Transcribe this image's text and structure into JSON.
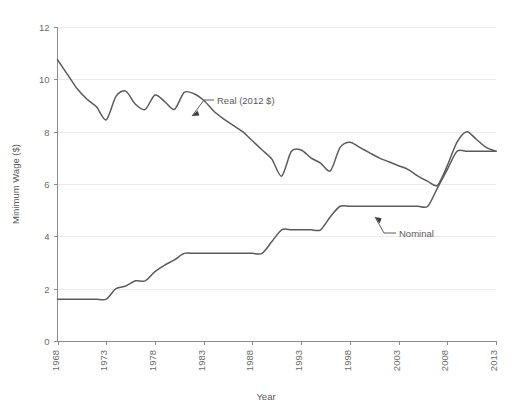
{
  "chart_data": {
    "type": "line",
    "title": "",
    "xlabel": "Year",
    "ylabel": "Minimum Wage ($)",
    "xlim": [
      1968,
      2013
    ],
    "ylim": [
      0,
      12
    ],
    "xticks": [
      1968,
      1973,
      1978,
      1983,
      1988,
      1993,
      1998,
      2003,
      2008,
      2013
    ],
    "xticklabels": [
      "1968",
      "1973",
      "1978",
      "1983",
      "1988",
      "1993",
      "1998",
      "2003",
      "2008",
      "2013"
    ],
    "yticks": [
      0,
      2,
      4,
      6,
      8,
      10,
      12
    ],
    "yticklabels": [
      "0",
      "2",
      "4",
      "6",
      "8",
      "10",
      "12"
    ],
    "grid": "horizontal",
    "legend_position": "inline-annotation",
    "line_color": "#5b5b5b",
    "grid_color": "#ebebeb",
    "axis_color": "#8c8c8c",
    "background_color": "#ffffff",
    "annotations": [
      {
        "name": "real-series-annotation",
        "text": "Real (2012 $)",
        "points_to_year": 1981,
        "points_to_value": 8.75
      },
      {
        "name": "nominal-series-annotation",
        "text": "Nominal",
        "points_to_year": 2003,
        "points_to_value": 5.15
      }
    ],
    "series": [
      {
        "name": "Real (2012 $)",
        "label": "Real (2012 $)",
        "x": [
          1968,
          1969,
          1970,
          1971,
          1972,
          1973,
          1974,
          1975,
          1976,
          1977,
          1978,
          1979,
          1980,
          1981,
          1982,
          1983,
          1984,
          1985,
          1986,
          1987,
          1988,
          1989,
          1990,
          1991,
          1992,
          1993,
          1994,
          1995,
          1996,
          1997,
          1998,
          1999,
          2000,
          2001,
          2002,
          2003,
          2004,
          2005,
          2006,
          2007,
          2008,
          2009,
          2010,
          2011,
          2012,
          2013
        ],
        "values": [
          10.75,
          10.2,
          9.65,
          9.25,
          8.95,
          8.45,
          9.35,
          9.55,
          9.05,
          8.85,
          9.4,
          9.15,
          8.85,
          9.5,
          9.45,
          9.2,
          8.8,
          8.5,
          8.25,
          8.0,
          7.65,
          7.3,
          6.95,
          6.3,
          7.25,
          7.3,
          7.0,
          6.8,
          6.5,
          7.4,
          7.6,
          7.4,
          7.2,
          7.0,
          6.85,
          6.7,
          6.55,
          6.3,
          6.1,
          5.95,
          6.7,
          7.6,
          8.0,
          7.7,
          7.4,
          7.25
        ]
      },
      {
        "name": "Nominal",
        "label": "Nominal",
        "x": [
          1968,
          1969,
          1970,
          1971,
          1972,
          1973,
          1974,
          1975,
          1976,
          1977,
          1978,
          1979,
          1980,
          1981,
          1982,
          1983,
          1984,
          1985,
          1986,
          1987,
          1988,
          1989,
          1990,
          1991,
          1992,
          1993,
          1994,
          1995,
          1996,
          1997,
          1998,
          1999,
          2000,
          2001,
          2002,
          2003,
          2004,
          2005,
          2006,
          2007,
          2008,
          2009,
          2010,
          2011,
          2012,
          2013
        ],
        "values": [
          1.6,
          1.6,
          1.6,
          1.6,
          1.6,
          1.6,
          2.0,
          2.1,
          2.3,
          2.3,
          2.65,
          2.9,
          3.1,
          3.35,
          3.35,
          3.35,
          3.35,
          3.35,
          3.35,
          3.35,
          3.35,
          3.35,
          3.8,
          4.25,
          4.25,
          4.25,
          4.25,
          4.25,
          4.75,
          5.15,
          5.15,
          5.15,
          5.15,
          5.15,
          5.15,
          5.15,
          5.15,
          5.15,
          5.15,
          5.85,
          6.55,
          7.25,
          7.25,
          7.25,
          7.25,
          7.25
        ]
      }
    ]
  }
}
